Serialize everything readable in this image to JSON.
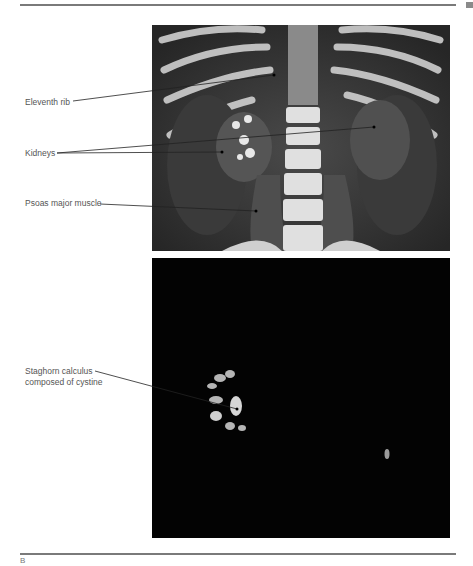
{
  "figure": {
    "top_panel": {
      "description": "Coronal CT reconstruction of abdomen",
      "labels": [
        {
          "text": "Eleventh rib"
        },
        {
          "text": "Kidneys"
        },
        {
          "text": "Psoas major muscle"
        }
      ]
    },
    "bottom_panel": {
      "description": "Bone-window CT showing renal calculus",
      "labels": [
        {
          "line1": "Staghorn calculus",
          "line2": "composed of cystine"
        }
      ]
    },
    "caption_fragment": "B"
  }
}
